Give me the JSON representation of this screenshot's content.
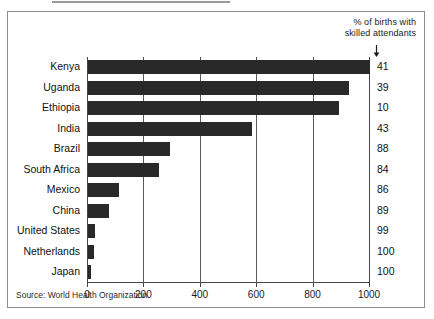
{
  "figure": {
    "source_note": "Source: World Health Organization.",
    "header_note_line1": "% of births with",
    "header_note_line2": "skilled attendants",
    "arrow_icon": "down-arrow-icon"
  },
  "chart_data": {
    "type": "bar",
    "orientation": "horizontal",
    "title": "",
    "subtitle": "",
    "xlabel": "",
    "ylabel": "",
    "xlim": [
      0,
      1000
    ],
    "xticks": [
      0,
      200,
      400,
      600,
      800,
      1000
    ],
    "xtick_labels": [
      "0",
      "200",
      "400",
      "600",
      "800",
      "1000"
    ],
    "grid": true,
    "grid_axis": "x",
    "legend": false,
    "bar_color": "#292929",
    "categories": [
      "Kenya",
      "Uganda",
      "Ethiopia",
      "India",
      "Brazil",
      "South Africa",
      "Mexico",
      "China",
      "United States",
      "Netherlands",
      "Japan"
    ],
    "values": [
      1000,
      925,
      890,
      580,
      290,
      250,
      110,
      75,
      25,
      20,
      12
    ],
    "annotation_column": {
      "header": "% of births with skilled attendants",
      "values": [
        "41",
        "39",
        "10",
        "43",
        "88",
        "84",
        "86",
        "89",
        "99",
        "100",
        "100"
      ]
    }
  }
}
